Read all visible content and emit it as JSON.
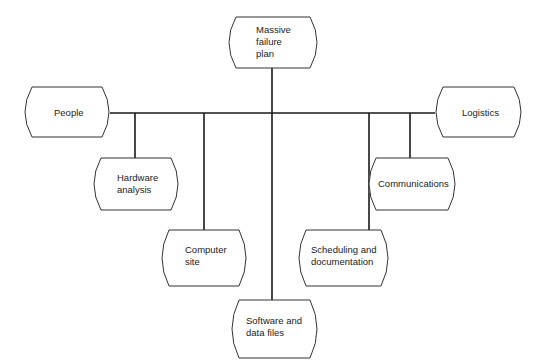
{
  "diagram": {
    "type": "tree",
    "root": {
      "id": "massive-failure-plan",
      "lines": [
        "Massive",
        "failure",
        "plan"
      ]
    },
    "nodes": [
      {
        "id": "people",
        "lines": [
          "People"
        ]
      },
      {
        "id": "hardware-analysis",
        "lines": [
          "Hardware",
          "analysis"
        ]
      },
      {
        "id": "computer-site",
        "lines": [
          "Computer",
          "site"
        ]
      },
      {
        "id": "software-and-data-files",
        "lines": [
          "Software and",
          "data files"
        ]
      },
      {
        "id": "scheduling-and-documentation",
        "lines": [
          "Scheduling and",
          "documentation"
        ]
      },
      {
        "id": "communications",
        "lines": [
          "Communications"
        ]
      },
      {
        "id": "logistics",
        "lines": [
          "Logistics"
        ]
      }
    ],
    "edges": [
      [
        "massive-failure-plan",
        "people"
      ],
      [
        "massive-failure-plan",
        "hardware-analysis"
      ],
      [
        "massive-failure-plan",
        "computer-site"
      ],
      [
        "massive-failure-plan",
        "software-and-data-files"
      ],
      [
        "massive-failure-plan",
        "scheduling-and-documentation"
      ],
      [
        "massive-failure-plan",
        "communications"
      ],
      [
        "massive-failure-plan",
        "logistics"
      ]
    ],
    "colors": {
      "line": "#1a1a1a",
      "shape_stroke": "#333333",
      "background": "#ffffff"
    }
  }
}
